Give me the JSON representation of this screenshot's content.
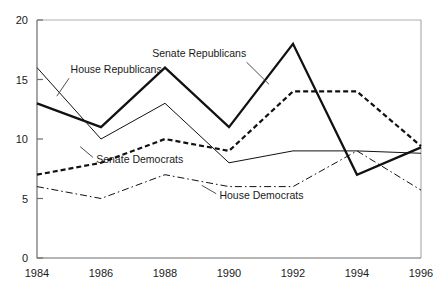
{
  "chart_data": {
    "type": "line",
    "title": "",
    "xlabel": "",
    "ylabel": "",
    "categories": [
      "1984",
      "1986",
      "1988",
      "1990",
      "1992",
      "1994",
      "1996"
    ],
    "x": [
      1984,
      1986,
      1988,
      1990,
      1992,
      1994,
      1996
    ],
    "xlim": [
      1984,
      1996
    ],
    "ylim": [
      0,
      20
    ],
    "yticks": [
      "0",
      "5",
      "10",
      "15",
      "20"
    ],
    "ytick_values": [
      0,
      5,
      10,
      15,
      20
    ],
    "grid": false,
    "legend_position": "inline-annotations",
    "series": [
      {
        "name": "House Republicans",
        "values": [
          16,
          10,
          13,
          8,
          9,
          9,
          8.8
        ],
        "style": "solid-thin",
        "color": "#111111",
        "label": "House Republicans"
      },
      {
        "name": "Senate Republicans",
        "values": [
          13,
          11,
          16,
          11,
          18,
          7,
          9.3
        ],
        "style": "solid-thick",
        "color": "#111111",
        "label": "Senate Republicans"
      },
      {
        "name": "Senate Democrats",
        "values": [
          7,
          8,
          10,
          9,
          14,
          14,
          9.4
        ],
        "style": "dashed",
        "color": "#111111",
        "label": "Senate Democrats"
      },
      {
        "name": "House Democrats",
        "values": [
          6,
          5,
          7,
          6,
          6,
          9,
          5.7
        ],
        "style": "dash-dot",
        "color": "#111111",
        "label": "House Democrats"
      }
    ],
    "annotations": [
      {
        "text": "House Republicans",
        "x": 1985.05,
        "y": 15.55
      },
      {
        "text": "Senate Republicans",
        "x": 1987.6,
        "y": 16.9
      },
      {
        "text": "Senate Democrats",
        "x": 1985.85,
        "y": 8.0
      },
      {
        "text": "House Democrats",
        "x": 1989.7,
        "y": 4.95
      }
    ]
  },
  "axis": {
    "y_labels": [
      "20",
      "15",
      "10",
      "5",
      "0"
    ],
    "x_labels": [
      "1984",
      "1986",
      "1988",
      "1990",
      "1992",
      "1994",
      "1996"
    ]
  }
}
